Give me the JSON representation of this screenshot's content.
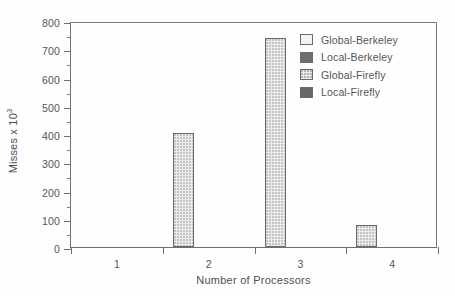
{
  "chart_data": {
    "type": "bar",
    "title": "",
    "xlabel": "Number of Processors",
    "ylabel": "Misses x 10",
    "ylabel_exponent": "3",
    "categories": [
      "1",
      "2",
      "3",
      "4"
    ],
    "xlim": [
      0.5,
      4.5
    ],
    "ylim": [
      0,
      800
    ],
    "yticks": [
      0,
      100,
      200,
      300,
      400,
      500,
      600,
      700,
      800
    ],
    "ytick_labels": [
      "0",
      "100",
      "200",
      "300",
      "400",
      "500",
      "600",
      "700",
      "800"
    ],
    "yminor_step": 50,
    "grid": false,
    "legend_position": "top-right",
    "series": [
      {
        "name": "Global-Berkeley",
        "swatch": "sw-light",
        "values": [
          0,
          403,
          740,
          78
        ]
      },
      {
        "name": "Local-Berkeley",
        "swatch": "sw-dark",
        "values": [
          0,
          0,
          0,
          0
        ]
      },
      {
        "name": "Global-Firefly",
        "swatch": "sw-stipple",
        "values": [
          0,
          0,
          0,
          0
        ]
      },
      {
        "name": "Local-Firefly",
        "swatch": "sw-darker",
        "values": [
          0,
          0,
          0,
          0
        ]
      }
    ]
  },
  "legend": {
    "items": [
      {
        "label": "Global-Berkeley",
        "swatch": "sw-light"
      },
      {
        "label": "Local-Berkeley",
        "swatch": "sw-dark"
      },
      {
        "label": "Global-Firefly",
        "swatch": "sw-stipple"
      },
      {
        "label": "Local-Firefly",
        "swatch": "sw-darker"
      }
    ]
  },
  "colors": {
    "axis": "#6f6f6f",
    "text": "#555555",
    "bar_fill": "#ededed",
    "bar_border": "#6a6a6a",
    "background": "#ffffff"
  }
}
